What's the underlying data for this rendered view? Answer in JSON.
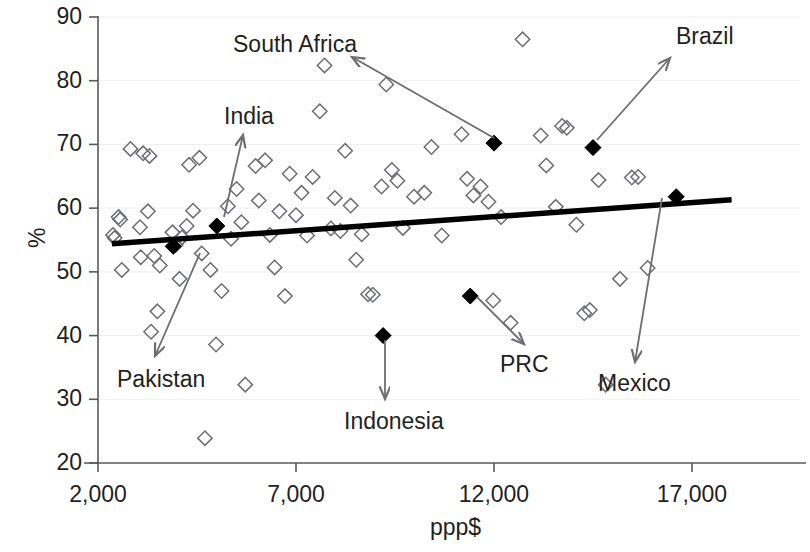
{
  "chart_data": {
    "type": "scatter",
    "title": "",
    "xlabel": "ppp$",
    "ylabel": "%",
    "xlim": [
      1000,
      19500
    ],
    "ylim": [
      20,
      90
    ],
    "xticks": [
      2000,
      7000,
      12000,
      17000
    ],
    "xtick_labels": [
      "2,000",
      "7,000",
      "12,000",
      "17,000"
    ],
    "yticks": [
      20,
      30,
      40,
      50,
      60,
      70,
      80,
      90
    ],
    "ytick_labels": [
      "20",
      "30",
      "40",
      "50",
      "60",
      "70",
      "80",
      "90"
    ],
    "grid": "horizontal-light",
    "legend": "none",
    "series": [
      {
        "name": "other-countries",
        "marker": "open-diamond",
        "color": "#6d6e71",
        "points": [
          [
            2380,
            55.8
          ],
          [
            2420,
            55.3
          ],
          [
            2520,
            58.6
          ],
          [
            2560,
            58.2
          ],
          [
            2600,
            50.3
          ],
          [
            2820,
            69.3
          ],
          [
            3060,
            57.0
          ],
          [
            3080,
            52.3
          ],
          [
            3140,
            68.6
          ],
          [
            3260,
            59.5
          ],
          [
            3300,
            68.2
          ],
          [
            3340,
            40.6
          ],
          [
            3420,
            52.5
          ],
          [
            3500,
            43.8
          ],
          [
            3560,
            51.0
          ],
          [
            3880,
            56.2
          ],
          [
            3960,
            54.2
          ],
          [
            4060,
            48.9
          ],
          [
            4120,
            55.4
          ],
          [
            4240,
            57.2
          ],
          [
            4300,
            66.8
          ],
          [
            4400,
            59.6
          ],
          [
            4560,
            67.9
          ],
          [
            4620,
            52.9
          ],
          [
            4700,
            23.9
          ],
          [
            4840,
            50.3
          ],
          [
            4980,
            38.6
          ],
          [
            5120,
            47.0
          ],
          [
            5280,
            60.3
          ],
          [
            5360,
            55.2
          ],
          [
            5500,
            63.0
          ],
          [
            5620,
            57.8
          ],
          [
            5720,
            32.3
          ],
          [
            5980,
            66.6
          ],
          [
            6060,
            61.2
          ],
          [
            6220,
            67.5
          ],
          [
            6340,
            55.8
          ],
          [
            6460,
            50.7
          ],
          [
            6580,
            59.5
          ],
          [
            6720,
            46.2
          ],
          [
            6840,
            65.4
          ],
          [
            7000,
            58.9
          ],
          [
            7140,
            62.4
          ],
          [
            7280,
            55.7
          ],
          [
            7420,
            64.9
          ],
          [
            7600,
            75.2
          ],
          [
            7720,
            82.4
          ],
          [
            7880,
            56.8
          ],
          [
            7980,
            61.6
          ],
          [
            8120,
            56.4
          ],
          [
            8240,
            69.0
          ],
          [
            8380,
            60.4
          ],
          [
            8520,
            51.9
          ],
          [
            8660,
            55.9
          ],
          [
            8820,
            46.5
          ],
          [
            8940,
            46.4
          ],
          [
            9160,
            63.4
          ],
          [
            9280,
            79.4
          ],
          [
            9420,
            66.0
          ],
          [
            9560,
            64.3
          ],
          [
            9700,
            56.9
          ],
          [
            9980,
            61.8
          ],
          [
            10240,
            62.4
          ],
          [
            10420,
            69.6
          ],
          [
            10680,
            55.7
          ],
          [
            11180,
            71.6
          ],
          [
            11320,
            64.6
          ],
          [
            11480,
            62.0
          ],
          [
            11660,
            63.4
          ],
          [
            11860,
            61.0
          ],
          [
            11980,
            45.5
          ],
          [
            12180,
            58.6
          ],
          [
            12420,
            42.0
          ],
          [
            12720,
            86.5
          ],
          [
            13180,
            71.4
          ],
          [
            13320,
            66.7
          ],
          [
            13560,
            60.2
          ],
          [
            13720,
            72.9
          ],
          [
            13840,
            72.6
          ],
          [
            14080,
            57.4
          ],
          [
            14280,
            43.5
          ],
          [
            14420,
            44.0
          ],
          [
            14640,
            64.4
          ],
          [
            14820,
            32.3
          ],
          [
            15180,
            48.9
          ],
          [
            15480,
            64.8
          ],
          [
            15640,
            64.9
          ],
          [
            15880,
            50.6
          ]
        ]
      },
      {
        "name": "highlighted-countries",
        "marker": "filled-diamond",
        "color": "#000000",
        "points": [
          {
            "label": "Pakistan",
            "x": 3900,
            "y": 54.0
          },
          {
            "label": "India",
            "x": 5000,
            "y": 57.2
          },
          {
            "label": "Indonesia",
            "x": 9200,
            "y": 40.0
          },
          {
            "label": "PRC",
            "x": 11400,
            "y": 46.2
          },
          {
            "label": "South Africa",
            "x": 12000,
            "y": 70.2
          },
          {
            "label": "Brazil",
            "x": 14500,
            "y": 69.5
          },
          {
            "label": "Mexico",
            "x": 16600,
            "y": 61.8
          }
        ]
      }
    ],
    "trendline": {
      "name": "linear-trendline",
      "color": "#000000",
      "x_start": 2350,
      "y_start": 54.4,
      "x_end": 18000,
      "y_end": 61.3
    },
    "annotations": [
      {
        "label": "South Africa",
        "label_x": 233,
        "label_y": 33,
        "arrow_from_x": 494,
        "arrow_from_y": 138,
        "arrow_to_x": 352,
        "arrow_to_y": 57
      },
      {
        "label": "Brazil",
        "label_x": 676,
        "label_y": 25,
        "arrow_from_x": 597,
        "arrow_from_y": 140,
        "arrow_to_x": 670,
        "arrow_to_y": 58
      },
      {
        "label": "India",
        "label_x": 224,
        "label_y": 105,
        "arrow_from_x": 224,
        "arrow_from_y": 217,
        "arrow_to_x": 243,
        "arrow_to_y": 135
      },
      {
        "label": "Pakistan",
        "label_x": 117,
        "label_y": 368,
        "arrow_from_x": 200,
        "arrow_from_y": 253,
        "arrow_to_x": 155,
        "arrow_to_y": 356
      },
      {
        "label": "Indonesia",
        "label_x": 344,
        "label_y": 410,
        "arrow_from_x": 385,
        "arrow_from_y": 340,
        "arrow_to_x": 385,
        "arrow_to_y": 399
      },
      {
        "label": "PRC",
        "label_x": 500,
        "label_y": 353,
        "arrow_from_x": 477,
        "arrow_from_y": 297,
        "arrow_to_x": 524,
        "arrow_to_y": 344
      },
      {
        "label": "Mexico",
        "label_x": 598,
        "label_y": 372,
        "arrow_from_x": 662,
        "arrow_from_y": 198,
        "arrow_to_x": 635,
        "arrow_to_y": 362
      }
    ]
  },
  "axes": {
    "y_title": "%",
    "x_title": "ppp$",
    "y_tick_labels": [
      "90",
      "80",
      "70",
      "60",
      "50",
      "40",
      "30",
      "20"
    ],
    "x_tick_labels": [
      "2,000",
      "7,000",
      "12,000",
      "17,000"
    ]
  },
  "annotation_labels": {
    "south_africa": "South Africa",
    "brazil": "Brazil",
    "india": "India",
    "pakistan": "Pakistan",
    "indonesia": "Indonesia",
    "prc": "PRC",
    "mexico": "Mexico"
  },
  "colors": {
    "open_marker": "#6d6e71",
    "filled_marker": "#000000",
    "trendline": "#000000",
    "axis": "#58595b",
    "grid": "#f0f0f2",
    "text": "#231f20",
    "background": "#ffffff"
  }
}
